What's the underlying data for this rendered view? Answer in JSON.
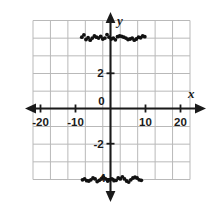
{
  "chart_data": {
    "type": "scatter",
    "title": "",
    "xlabel": "x",
    "ylabel": "y",
    "xlim": [
      -22.5,
      22.5
    ],
    "ylim": [
      -6.5,
      6.5
    ],
    "grid": true,
    "grid_step_x": 5,
    "grid_step_y": 1,
    "legend": "none",
    "x_ticks": [
      -20,
      -10,
      0,
      10,
      20
    ],
    "x_tick_labels": [
      "-20",
      "-10",
      "0",
      "10",
      "20"
    ],
    "y_ticks": [
      2,
      -2,
      -4
    ],
    "y_tick_labels": [
      "2",
      "-2",
      "4"
    ],
    "origin_label": "0",
    "series": [
      {
        "name": "upper branch",
        "approx_y": 4,
        "points": [
          [
            -8.2,
            4.05
          ],
          [
            -7.6,
            4.18
          ],
          [
            -7.0,
            3.92
          ],
          [
            -6.4,
            4.02
          ],
          [
            -5.8,
            3.88
          ],
          [
            -5.2,
            4.0
          ],
          [
            -4.6,
            4.12
          ],
          [
            -4.0,
            4.05
          ],
          [
            -3.4,
            4.0
          ],
          [
            -2.8,
            4.1
          ],
          [
            -2.2,
            3.95
          ],
          [
            -1.6,
            4.0
          ],
          [
            -1.0,
            4.2
          ],
          [
            -0.4,
            4.05
          ],
          [
            0.2,
            3.95
          ],
          [
            0.8,
            4.0
          ],
          [
            1.4,
            3.9
          ],
          [
            2.0,
            4.08
          ],
          [
            2.6,
            4.12
          ],
          [
            3.2,
            4.1
          ],
          [
            3.8,
            4.05
          ],
          [
            4.4,
            4.0
          ],
          [
            5.0,
            3.92
          ],
          [
            5.6,
            3.95
          ],
          [
            6.2,
            4.0
          ],
          [
            6.8,
            3.88
          ],
          [
            7.4,
            3.95
          ],
          [
            8.0,
            4.05
          ],
          [
            8.6,
            4.02
          ],
          [
            9.2,
            4.12
          ],
          [
            9.8,
            4.08
          ]
        ]
      },
      {
        "name": "lower branch",
        "approx_y": -4,
        "points": [
          [
            -8.0,
            -4.05
          ],
          [
            -7.4,
            -4.0
          ],
          [
            -6.8,
            -4.1
          ],
          [
            -6.2,
            -4.12
          ],
          [
            -5.6,
            -4.05
          ],
          [
            -5.0,
            -3.95
          ],
          [
            -4.4,
            -4.0
          ],
          [
            -3.8,
            -4.15
          ],
          [
            -3.2,
            -4.08
          ],
          [
            -2.6,
            -4.0
          ],
          [
            -2.0,
            -3.9
          ],
          [
            -1.4,
            -4.0
          ],
          [
            -0.8,
            -4.12
          ],
          [
            -0.2,
            -4.05
          ],
          [
            0.4,
            -4.0
          ],
          [
            1.0,
            -4.1
          ],
          [
            1.6,
            -4.08
          ],
          [
            2.2,
            -3.95
          ],
          [
            2.8,
            -4.0
          ],
          [
            3.4,
            -3.88
          ],
          [
            4.0,
            -4.0
          ],
          [
            4.6,
            -4.12
          ],
          [
            5.2,
            -4.18
          ],
          [
            5.8,
            -4.05
          ],
          [
            6.4,
            -3.95
          ],
          [
            7.0,
            -3.9
          ],
          [
            7.6,
            -3.95
          ],
          [
            8.2,
            -4.05
          ],
          [
            8.8,
            -4.08
          ]
        ]
      }
    ]
  },
  "figure": {
    "x_axis_label": "x",
    "y_axis_label": "y"
  }
}
